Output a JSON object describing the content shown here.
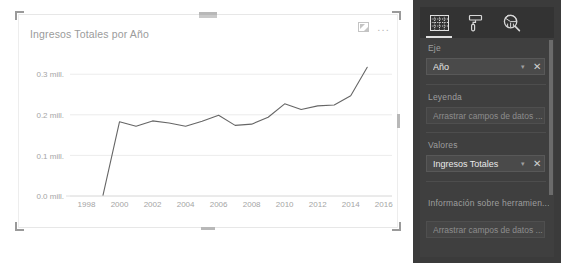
{
  "visual": {
    "title": "Ingresos Totales por Año",
    "header_icons": [
      {
        "name": "focus-mode-icon",
        "label": "Focus mode"
      },
      {
        "name": "more-options-icon",
        "label": "..."
      }
    ]
  },
  "chart_data": {
    "type": "line",
    "title": "Ingresos Totales por Año",
    "xlabel": "Año",
    "ylabel": "Ingresos Totales",
    "grid": true,
    "legend": "none",
    "xtick_labels": [
      "1998",
      "2000",
      "2002",
      "2004",
      "2006",
      "2008",
      "2010",
      "2012",
      "2014",
      "2016"
    ],
    "xtick_values": [
      1998,
      2000,
      2002,
      2004,
      2006,
      2008,
      2010,
      2012,
      2014,
      2016
    ],
    "ytick_labels": [
      "0.0 mill.",
      "0.1 mill.",
      "0.2 mill.",
      "0.3 mill."
    ],
    "ytick_values": [
      0,
      100000,
      200000,
      300000
    ],
    "xlim": [
      1997,
      2016.5
    ],
    "ylim": [
      0,
      335000
    ],
    "series": [
      {
        "name": "Ingresos Totales",
        "color": "#666666",
        "x": [
          1999,
          2000,
          2001,
          2002,
          2003,
          2004,
          2005,
          2006,
          2007,
          2008,
          2009,
          2010,
          2011,
          2012,
          2013,
          2014,
          2015
        ],
        "values": [
          2000,
          183000,
          172000,
          185000,
          180000,
          172000,
          184000,
          199000,
          174000,
          177000,
          194000,
          227000,
          213000,
          222000,
          224000,
          247000,
          317000
        ]
      }
    ]
  },
  "pane": {
    "tabs": [
      {
        "name": "fields-tab",
        "icon": "table-grid-icon",
        "active": true
      },
      {
        "name": "format-tab",
        "icon": "paint-roller-icon",
        "active": false
      },
      {
        "name": "analytics-tab",
        "icon": "magnifier-chart-icon",
        "active": false
      }
    ],
    "sections": [
      {
        "label": "Eje",
        "field": {
          "label": "Año",
          "caret": "▾",
          "close": "✕"
        }
      },
      {
        "label": "Leyenda",
        "dropzone": "Arrastrar campos de datos ..."
      },
      {
        "label": "Valores",
        "field": {
          "label": "Ingresos Totales",
          "caret": "▾",
          "close": "✕"
        }
      },
      {
        "label": "Información sobre herramien...",
        "dropzone": "Arrastrar campos de datos ..."
      }
    ]
  }
}
